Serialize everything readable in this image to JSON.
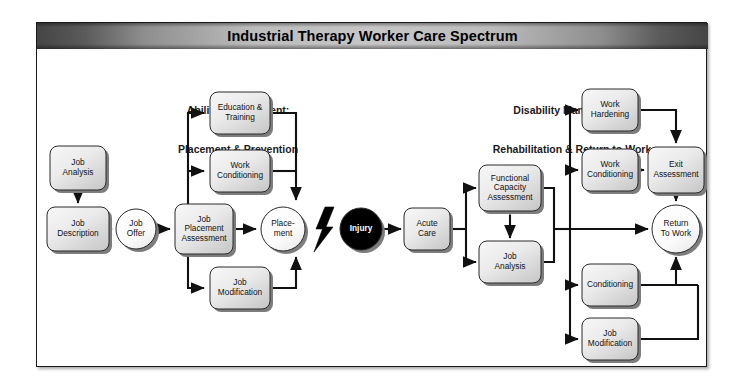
{
  "title": "Industrial Therapy Worker Care Spectrum",
  "sections": {
    "left": {
      "line1": "Ability Management:",
      "line2": "Placement & Prevention"
    },
    "right": {
      "line1": "Disability Management:",
      "line2": "Rehabilitation & Return to Work"
    }
  },
  "colors": {
    "titlebar_dark": "#454545",
    "titlebar_light": "#c6c6c6",
    "node_fill_light": "#f2f2f2",
    "node_fill_dark": "#cfcfcf",
    "node_border": "#2a2a2a",
    "shadow": "#7d7d7d",
    "injury_fill": "#000000",
    "edge": "#111111",
    "frame_border": "#1a1a1a"
  },
  "nodes": [
    {
      "id": "job-analysis-left",
      "shape": "box",
      "lines": [
        "Job",
        "Analysis"
      ],
      "x": 78,
      "y": 168,
      "w": 56,
      "h": 44
    },
    {
      "id": "job-description",
      "shape": "box",
      "lines": [
        "Job",
        "Description"
      ],
      "x": 78,
      "y": 229,
      "w": 62,
      "h": 44
    },
    {
      "id": "job-offer",
      "shape": "circle",
      "lines": [
        "Job",
        "Offer"
      ],
      "x": 136,
      "y": 229,
      "r": 20
    },
    {
      "id": "job-placement-assessment",
      "shape": "box",
      "lines": [
        "Job",
        "Placement",
        "Assessment"
      ],
      "x": 204,
      "y": 229,
      "w": 58,
      "h": 50
    },
    {
      "id": "education-training",
      "shape": "box",
      "lines": [
        "Education &",
        "Training"
      ],
      "x": 240,
      "y": 113,
      "w": 60,
      "h": 42
    },
    {
      "id": "work-conditioning-left",
      "shape": "box",
      "lines": [
        "Work",
        "Conditioning"
      ],
      "x": 240,
      "y": 171,
      "w": 60,
      "h": 42
    },
    {
      "id": "job-modification-left",
      "shape": "box",
      "lines": [
        "Job",
        "Modification"
      ],
      "x": 240,
      "y": 288,
      "w": 60,
      "h": 42
    },
    {
      "id": "placement",
      "shape": "circle",
      "lines": [
        "Place-",
        "ment"
      ],
      "x": 283,
      "y": 229,
      "r": 22
    },
    {
      "id": "injury",
      "shape": "circle",
      "lines": [
        "Injury"
      ],
      "x": 361,
      "y": 229,
      "r": 21,
      "dark": true
    },
    {
      "id": "acute-care",
      "shape": "box",
      "lines": [
        "Acute",
        "Care"
      ],
      "x": 427,
      "y": 229,
      "w": 46,
      "h": 42
    },
    {
      "id": "functional-capacity",
      "shape": "box",
      "lines": [
        "Functional",
        "Capacity",
        "Assessment"
      ],
      "x": 510,
      "y": 188,
      "w": 62,
      "h": 46
    },
    {
      "id": "job-analysis-right",
      "shape": "box",
      "lines": [
        "Job",
        "Analysis"
      ],
      "x": 510,
      "y": 262,
      "w": 62,
      "h": 42
    },
    {
      "id": "work-hardening",
      "shape": "box",
      "lines": [
        "Work",
        "Hardening"
      ],
      "x": 610,
      "y": 110,
      "w": 56,
      "h": 42
    },
    {
      "id": "work-conditioning-right",
      "shape": "box",
      "lines": [
        "Work",
        "Conditioning"
      ],
      "x": 610,
      "y": 170,
      "w": 56,
      "h": 42
    },
    {
      "id": "exit-assessment",
      "shape": "box",
      "lines": [
        "Exit",
        "Assessment"
      ],
      "x": 676,
      "y": 170,
      "w": 56,
      "h": 46
    },
    {
      "id": "conditioning",
      "shape": "box",
      "lines": [
        "Conditioning"
      ],
      "x": 610,
      "y": 285,
      "w": 56,
      "h": 42
    },
    {
      "id": "job-modification-right",
      "shape": "box",
      "lines": [
        "Job",
        "Modification"
      ],
      "x": 610,
      "y": 339,
      "w": 56,
      "h": 42
    },
    {
      "id": "return-to-work",
      "shape": "circle",
      "lines": [
        "Return",
        "To Work"
      ],
      "x": 676,
      "y": 229,
      "r": 24
    }
  ],
  "icons": {
    "lightning": "lightning-bolt-icon"
  },
  "edges": [
    "job-analysis-left -> job-description",
    "job-description -> job-offer",
    "job-offer -> job-placement-assessment",
    "job-placement-assessment -> education-training",
    "job-placement-assessment -> work-conditioning-left",
    "job-placement-assessment -> job-modification-left",
    "job-placement-assessment -> placement",
    "education-training -> placement",
    "work-conditioning-left -> placement",
    "job-modification-left -> placement",
    "injury -> acute-care",
    "acute-care -> functional-capacity",
    "acute-care -> job-analysis-right",
    "functional-capacity <-> job-analysis-right",
    "functional-capacity -> work-hardening",
    "functional-capacity -> work-conditioning-right",
    "functional-capacity -> conditioning",
    "functional-capacity -> job-modification-right",
    "functional-capacity -> return-to-work",
    "work-hardening -> exit-assessment",
    "work-conditioning-right -> exit-assessment",
    "exit-assessment -> return-to-work",
    "conditioning -> return-to-work",
    "job-modification-right -> return-to-work"
  ]
}
